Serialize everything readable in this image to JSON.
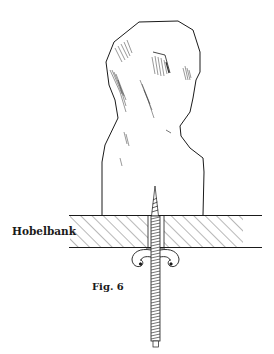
{
  "figure": {
    "bench_label": "Hobelbank",
    "caption": "Fig. 6"
  },
  "colors": {
    "ink": "#1a1a1a",
    "background": "#ffffff"
  }
}
